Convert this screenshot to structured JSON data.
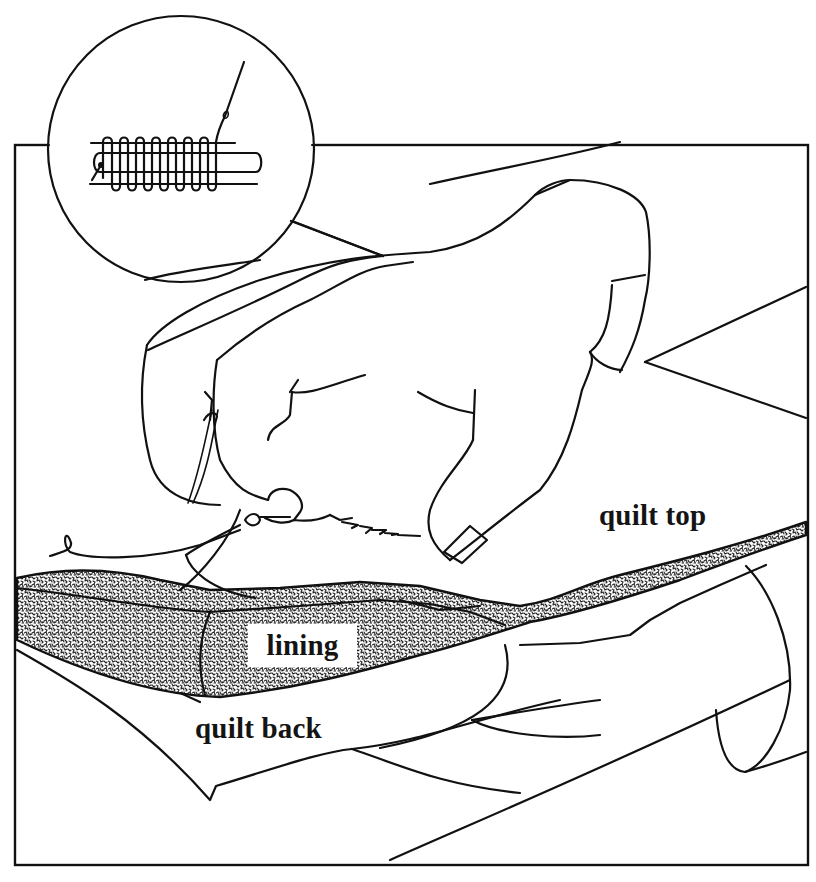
{
  "figure": {
    "colors": {
      "ink": "#111111",
      "paper": "#ffffff",
      "stipple_dark": "#222222"
    },
    "labels": {
      "quilt_top": "quilt top",
      "lining": "lining",
      "quilt_back": "quilt back"
    },
    "inset": {
      "name": "stitch-detail-magnifier",
      "stitch_loops": 6
    },
    "stitches_visible": 5
  }
}
